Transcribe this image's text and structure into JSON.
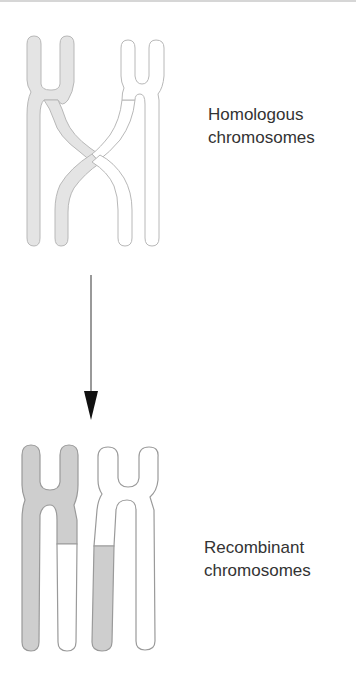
{
  "labels": {
    "homologous": {
      "line1": "Homologous",
      "line2": "chromosomes"
    },
    "recombinant": {
      "line1": "Recombinant",
      "line2": "chromosomes"
    }
  },
  "colors": {
    "homolog_fill_maternal": "#e4e4e4",
    "homolog_outline": "#b8b8b8",
    "recombinant_fill_gray": "#cecece",
    "recombinant_outline": "#9a9a9a",
    "arrow": "#111111",
    "text": "#333333"
  },
  "icons": {
    "arrow": "down-arrow"
  }
}
